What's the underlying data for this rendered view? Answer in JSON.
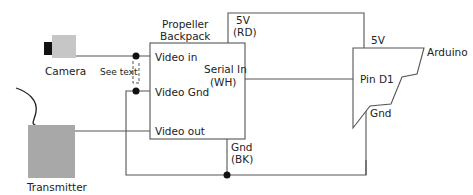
{
  "components": {
    "camera": {
      "label": "Camera",
      "color": "#c6c6c6",
      "lens_color": "#111111"
    },
    "transmitter": {
      "label": "Transmitter",
      "color": "#a8a8a8"
    },
    "backpack": {
      "title_line1": "Propeller",
      "title_line2": "Backpack",
      "pins": {
        "video_in": "Video in",
        "video_gnd": "Video Gnd",
        "video_out": "Video out",
        "serial_in_line1": "Serial In",
        "serial_in_line2": "(WH)",
        "power_line1": "5V",
        "power_line2": "(RD)",
        "gnd_line1": "Gnd",
        "gnd_line2": "(BK)"
      }
    },
    "arduino": {
      "label": "Arduino",
      "pins": {
        "power": "5V",
        "d1": "Pin D1",
        "gnd": "Gnd"
      }
    }
  },
  "annotations": {
    "see_text": "See text"
  },
  "colors": {
    "wire": "#555555",
    "junction": "#111111"
  }
}
